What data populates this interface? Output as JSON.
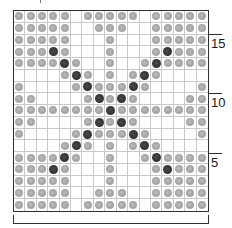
{
  "chart": {
    "columns": 17,
    "rows": 17,
    "legend": {
      "L": {
        "name": "light bead",
        "color": "#a8a8a8"
      },
      "D": {
        "name": "dark bead",
        "color": "#363636"
      },
      ".": {
        "name": "empty",
        "color": "#ffffff"
      }
    },
    "grid": [
      "LLLLL.LLLLL.LLLLL",
      "LLLLL..LLL..LLLLL",
      "LLLLL...L...LLLLL",
      "LLLDL...L...LDLLL",
      "LLLLDL..L..LDLLLL",
      "....LDL.L.LDL....",
      "L....LDLLLDL....L",
      "LL....LDLDL....LL",
      "LLLLLLLLDLLLLLLLL",
      "LL....LDLDL....LL",
      "L....LDLLLDL....L",
      "....LDL.L.LDL....",
      "LLLLDL..L..LDLLLL",
      "LLLDL...L...LDLLL",
      "LLLLL...L...LLLLL",
      "LLLLL..LLL..LLLLL",
      "LLLLL.LLLLL.LLLLL"
    ]
  },
  "row_markers": [
    {
      "label": "15",
      "row_line": 2
    },
    {
      "label": "10",
      "row_line": 7
    },
    {
      "label": "5",
      "row_line": 12
    }
  ]
}
